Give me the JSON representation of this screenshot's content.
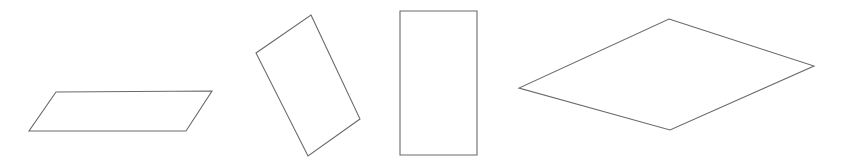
{
  "figure": {
    "width": 847,
    "height": 164,
    "background_color": "#ffffff",
    "stroke_color": "#6a6a6a",
    "fill_color": "#ffffff",
    "stroke_width": 1.1,
    "shape_count": 4
  },
  "shapes": [
    {
      "id": "shape-1",
      "name": "parallelogram",
      "label": "Slanted parallelogram",
      "vertices": [
        [
          56,
          92
        ],
        [
          212,
          91
        ],
        [
          186,
          131
        ],
        [
          29,
          131
        ]
      ],
      "points": "56,92 212,91 186,131 29,131",
      "bbox": [
        29,
        91,
        183,
        40
      ]
    },
    {
      "id": "shape-2",
      "name": "rotated-rectangle",
      "label": "Rotated rectangle",
      "vertices": [
        [
          311,
          15
        ],
        [
          360,
          119
        ],
        [
          308,
          156
        ],
        [
          256,
          53
        ]
      ],
      "points": "311,15 360,119 308,156 256,53",
      "bbox": [
        256,
        15,
        104,
        141
      ]
    },
    {
      "id": "shape-3",
      "name": "upright-rectangle",
      "label": "Upright rectangle",
      "vertices": [
        [
          400,
          11
        ],
        [
          477,
          11
        ],
        [
          477,
          155
        ],
        [
          400,
          155
        ]
      ],
      "points": "400,11 477,11 477,155 400,155",
      "bbox": [
        400,
        11,
        77,
        144
      ]
    },
    {
      "id": "shape-4",
      "name": "rhombus",
      "label": "Wide rhombus",
      "vertices": [
        [
          669,
          19
        ],
        [
          814,
          66
        ],
        [
          670,
          130
        ],
        [
          519,
          88
        ]
      ],
      "points": "669,19 814,66 670,130 519,88",
      "bbox": [
        519,
        19,
        295,
        111
      ]
    }
  ],
  "chart_data": {
    "type": "diagram",
    "subtitle": "",
    "xlabel": "",
    "ylabel": "",
    "items": [
      {
        "name": "parallelogram",
        "sides": 4,
        "position": "left"
      },
      {
        "name": "rotated-rectangle",
        "sides": 4,
        "position": "center-left"
      },
      {
        "name": "upright-rectangle",
        "sides": 4,
        "position": "center-right"
      },
      {
        "name": "rhombus",
        "sides": 4,
        "position": "right"
      }
    ]
  }
}
